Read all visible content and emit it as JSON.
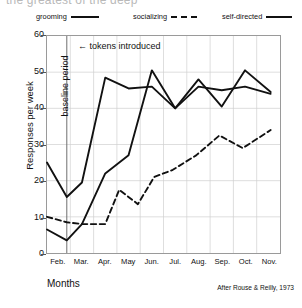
{
  "cut_title": "the greatest of the deep",
  "legend": {
    "items": [
      {
        "label": "grooming",
        "style": "solid",
        "color": "#111111"
      },
      {
        "label": "socializing",
        "style": "dashed",
        "color": "#111111"
      },
      {
        "label": "self-directed",
        "style": "solid",
        "color": "#111111"
      }
    ]
  },
  "annotations": {
    "baseline": "baseline period",
    "tokens": "tokens introduced",
    "arrow": "left-arrow-icon"
  },
  "credit": "After Rouse & Reilly, 1973",
  "chart_data": {
    "type": "line",
    "title": "",
    "xlabel": "Months",
    "ylabel": "Responses per week",
    "categories": [
      "Feb.",
      "Mar.",
      "Apr.",
      "May",
      "Jun.",
      "Jul.",
      "Aug.",
      "Sep.",
      "Oct.",
      "Nov."
    ],
    "ylim": [
      0,
      60
    ],
    "yticks": [
      0,
      10,
      20,
      30,
      40,
      50,
      60
    ],
    "xlim": [
      0,
      10
    ],
    "grid": true,
    "legend_position": "top",
    "vline": {
      "x": 0.85,
      "label": "tokens introduced"
    },
    "series": [
      {
        "name": "grooming",
        "style": "solid",
        "x": [
          0.0,
          0.85,
          1.5,
          2.5,
          3.5,
          4.5,
          5.5,
          6.5,
          7.5,
          8.5,
          9.6
        ],
        "values": [
          25,
          15.5,
          19.5,
          48.5,
          45.5,
          46,
          40,
          46,
          45,
          46,
          44
        ]
      },
      {
        "name": "socializing",
        "style": "dashed",
        "x": [
          0.0,
          0.85,
          1.5,
          2.5,
          3.1,
          3.9,
          4.6,
          5.4,
          6.4,
          7.4,
          8.4,
          9.6
        ],
        "values": [
          10,
          8.5,
          8,
          8,
          17.5,
          13.5,
          21,
          23,
          27,
          32.5,
          29,
          34
        ]
      },
      {
        "name": "self-directed",
        "style": "solid",
        "x": [
          0.0,
          0.85,
          1.5,
          2.5,
          3.5,
          4.5,
          5.5,
          6.5,
          7.5,
          8.5,
          9.6
        ],
        "values": [
          6.5,
          3.5,
          8,
          22,
          27,
          50.5,
          40,
          48,
          40.5,
          50.5,
          44.5
        ]
      }
    ]
  }
}
